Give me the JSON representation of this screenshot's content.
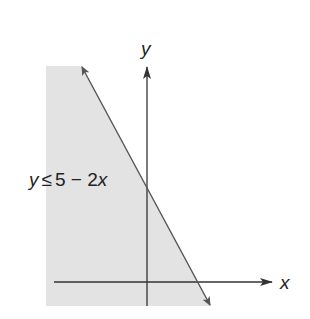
{
  "diagram": {
    "type": "linear-inequality-graph",
    "inequality_label": "y ≤ 5 − 2x",
    "x_axis_label": "x",
    "y_axis_label": "y",
    "boundary_line": "y = 5 − 2x",
    "shaded_side": "below / left of line",
    "colors": {
      "shade": "#e3e3e3",
      "line": "#555555",
      "axes": "#333333",
      "text": "#222222"
    }
  },
  "label_parts": {
    "y": "y",
    "leq": "≤",
    "rhs_const": "5 − 2",
    "rhs_var": "x"
  }
}
